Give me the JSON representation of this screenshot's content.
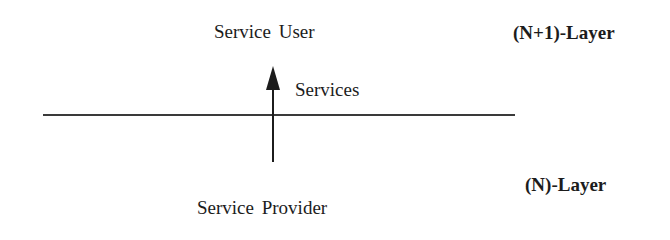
{
  "diagram": {
    "service_user": "Service User",
    "services": "Services",
    "service_provider": "Service Provider",
    "upper_layer": "(N+1)-Layer",
    "lower_layer": "(N)-Layer",
    "colors": {
      "line": "#3a3a3a",
      "text": "#1c1c1c",
      "background": "#ffffff"
    }
  }
}
